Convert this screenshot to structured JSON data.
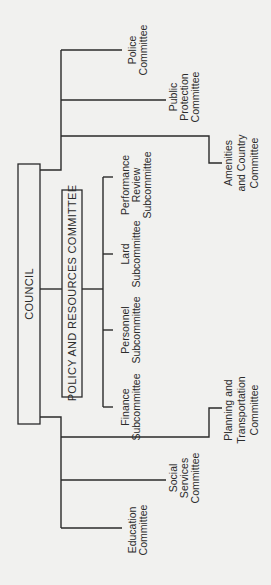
{
  "diagram": {
    "type": "organization-chart",
    "orientation": "rotated-90-ccw",
    "root": {
      "label": "COUNCIL"
    },
    "policy_committee": {
      "label": "POLICY AND RESOURCES COMMITTEE",
      "subcommittees": [
        {
          "lines": [
            "Performance",
            "Review",
            "Subcommittee"
          ]
        },
        {
          "lines": [
            "Lard",
            "Subcommittee"
          ]
        },
        {
          "lines": [
            "Personnel",
            "Subcommittee"
          ]
        },
        {
          "lines": [
            "Finance",
            "Subcommittee"
          ]
        }
      ]
    },
    "upper_committees": [
      {
        "lines": [
          "Police",
          "Committee"
        ]
      },
      {
        "lines": [
          "Public",
          "Protection",
          "Committee"
        ]
      },
      {
        "lines": [
          "Amenities",
          "and Country",
          "Committee"
        ]
      }
    ],
    "lower_committees": [
      {
        "lines": [
          "Planning and",
          "Transportation",
          "Committee"
        ]
      },
      {
        "lines": [
          "Social",
          "Services",
          "Committee"
        ]
      },
      {
        "lines": [
          "Education",
          "Committee"
        ]
      }
    ],
    "colors": {
      "background": "#f1f1ef",
      "line": "#2a2a2a",
      "text": "#2b2b2b"
    }
  }
}
